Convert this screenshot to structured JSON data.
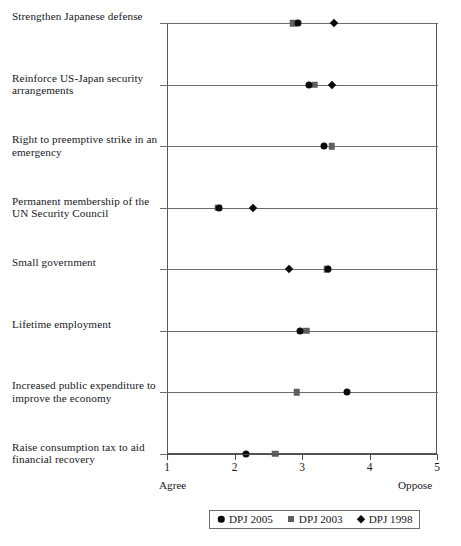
{
  "chart_data": {
    "type": "scatter",
    "title": "",
    "subtitle": "",
    "xlabel": "",
    "ylabel": "",
    "xlim": [
      1,
      5
    ],
    "xticks": [
      1,
      2,
      3,
      4,
      5
    ],
    "xtick_labels": [
      "1",
      "2",
      "3",
      "4",
      "5"
    ],
    "axis_low_label": "Agree",
    "axis_high_label": "Oppose",
    "grid": "horizontal category rules",
    "legend_position": "bottom-center",
    "categories": [
      "Strengthen Japanese defense",
      "Reinforce US-Japan security arrangements",
      "Right to preemptive strike in an emergency",
      "Permanent membership of the UN Security Council",
      "Small government",
      "Lifetime employment",
      "Increased public expenditure to improve the economy",
      "Raise consumption tax to aid financial recovery"
    ],
    "series": [
      {
        "name": "DPJ 2005",
        "marker": "circle",
        "color": "#0b0b0b",
        "values": [
          2.94,
          3.1,
          3.32,
          1.77,
          3.39,
          2.97,
          3.66,
          2.17
        ]
      },
      {
        "name": "DPJ 2003",
        "marker": "square",
        "color": "#5c5f63",
        "values": [
          2.87,
          3.19,
          3.44,
          1.76,
          3.37,
          3.06,
          2.92,
          2.6
        ]
      },
      {
        "name": "DPJ 1998",
        "marker": "diamond",
        "color": "#0b0b0b",
        "values": [
          3.47,
          3.45,
          null,
          2.28,
          2.81,
          null,
          null,
          null
        ]
      }
    ]
  },
  "legend": {
    "entries": [
      {
        "label": "DPJ 2005",
        "marker": "circle"
      },
      {
        "label": "DPJ 2003",
        "marker": "square"
      },
      {
        "label": "DPJ 1998",
        "marker": "diamond"
      }
    ]
  }
}
